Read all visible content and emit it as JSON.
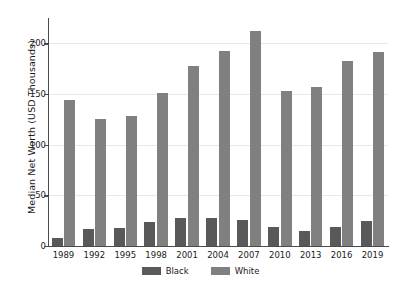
{
  "chart_data": {
    "type": "bar",
    "title": "",
    "xlabel": "",
    "ylabel": "Median Net Worth (USD Thousands)",
    "categories": [
      "1989",
      "1992",
      "1995",
      "1998",
      "2001",
      "2004",
      "2007",
      "2010",
      "2013",
      "2016",
      "2019"
    ],
    "series": [
      {
        "name": "Black",
        "color": "#595959",
        "values": [
          8,
          17,
          18,
          24,
          28,
          28,
          26,
          19,
          15,
          19,
          25
        ]
      },
      {
        "name": "White",
        "color": "#808080",
        "values": [
          144,
          125,
          128,
          151,
          178,
          192,
          212,
          153,
          157,
          183,
          191
        ]
      }
    ],
    "ylim": [
      0,
      225
    ],
    "yticks": [
      0,
      50,
      100,
      150,
      200
    ],
    "ytick_labels": [
      "0",
      "50",
      "100",
      "150",
      "200"
    ],
    "grid": true,
    "legend_position": "bottom-center"
  }
}
